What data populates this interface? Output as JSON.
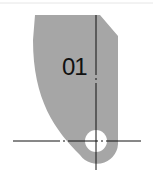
{
  "diagram": {
    "part_label": "01",
    "colors": {
      "part_fill": "#a6a6a6",
      "hole_fill": "#ffffff",
      "centerline": "#111111",
      "top_rule": "#e6e6e6"
    }
  }
}
